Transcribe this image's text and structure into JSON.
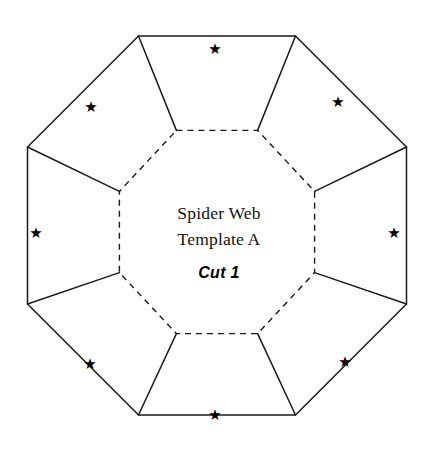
{
  "page": {
    "background_color": "#ffffff",
    "line_color": "#1a1a1a",
    "width": 433,
    "height": 452
  },
  "template": {
    "name": "spider-web-template-a",
    "title_line_1": "Spider Web",
    "title_line_2": "Template A",
    "cut_label": "Cut 1",
    "outer_shape": "octagon",
    "inner_shape": "octagon",
    "inner_line_style": "dashed",
    "outer_line_style": "solid",
    "fold_line_style": "solid",
    "flap_count": 8
  },
  "geometry": {
    "center_x": 217,
    "center_y": 232,
    "outer_circumradius": 205,
    "inner_circumradius": 106,
    "star_radius": 162,
    "rotation_deg": 22.5
  },
  "stars": [
    {
      "id": "star-top",
      "glyph": "★",
      "position": "top-flap"
    },
    {
      "id": "star-top-right",
      "glyph": "★",
      "position": "top-right-flap"
    },
    {
      "id": "star-right",
      "glyph": "★",
      "position": "right-flap"
    },
    {
      "id": "star-bottom-right",
      "glyph": "★",
      "position": "bottom-right-flap"
    },
    {
      "id": "star-bottom",
      "glyph": "★",
      "position": "bottom-flap"
    },
    {
      "id": "star-bottom-left",
      "glyph": "★",
      "position": "bottom-left-flap"
    },
    {
      "id": "star-left",
      "glyph": "★",
      "position": "left-flap"
    },
    {
      "id": "star-top-left",
      "glyph": "★",
      "position": "top-left-flap"
    }
  ]
}
